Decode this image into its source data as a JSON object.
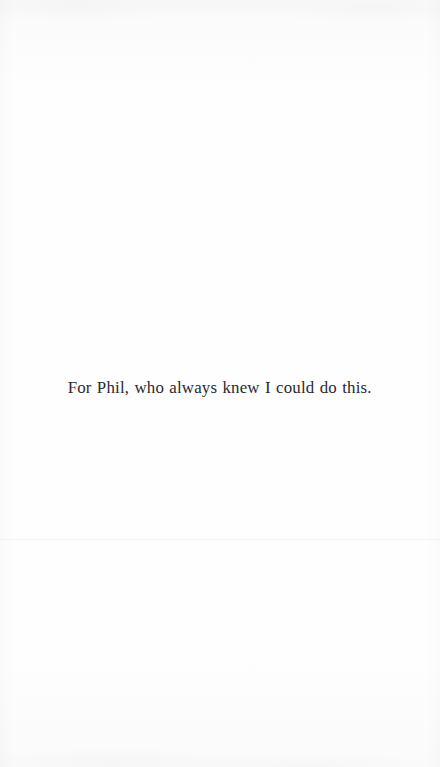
{
  "page": {
    "kind": "book-dedication-page",
    "background_color": "#fefefe",
    "width": 440,
    "height": 767
  },
  "dedication": {
    "text": "For Phil, who always knew I could do this.",
    "text_color": "#2b2a2c",
    "alignment": "center",
    "font_size_px": 17.4,
    "baseline_y": 392,
    "left_x": 68,
    "right_x": 372
  },
  "artifacts": {
    "scan_seam": {
      "name": "horizontal-scan-seam",
      "y": 538,
      "color": "#969aa2"
    },
    "paper_grain_color": "#969aa2"
  }
}
